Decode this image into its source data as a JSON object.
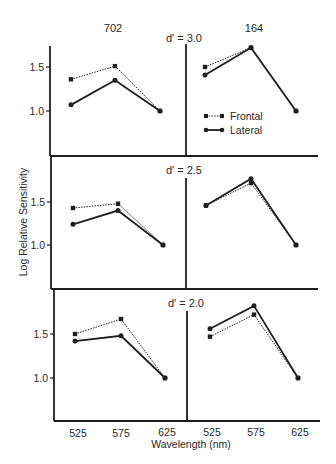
{
  "chart_data": {
    "type": "line",
    "title": "",
    "xlabel": "Wavelength (nm)",
    "ylabel": "Log Relative Sensitivity",
    "categories": [
      "525",
      "575",
      "625"
    ],
    "column_labels": [
      "702",
      "164"
    ],
    "ylim": [
      0.6,
      1.8
    ],
    "yticks": [
      "1.0",
      "1.5"
    ],
    "grid": false,
    "legend": {
      "position": "upper-right panel (top row, column 164)",
      "entries": [
        "Frontal",
        "Lateral"
      ]
    },
    "series_styles": {
      "Frontal": {
        "line": "dotted",
        "marker": "square"
      },
      "Lateral": {
        "line": "solid",
        "marker": "circle"
      }
    },
    "panels": [
      {
        "row_label": "d′ = 3.0",
        "column": "702",
        "series": [
          {
            "name": "Frontal",
            "values": [
              1.36,
              1.51,
              1.0
            ]
          },
          {
            "name": "Lateral",
            "values": [
              1.07,
              1.35,
              1.0
            ]
          }
        ]
      },
      {
        "row_label": "d′ = 3.0",
        "column": "164",
        "series": [
          {
            "name": "Frontal",
            "values": [
              1.5,
              1.72,
              1.0
            ]
          },
          {
            "name": "Lateral",
            "values": [
              1.41,
              1.72,
              1.0
            ]
          }
        ]
      },
      {
        "row_label": "d′ = 2.5",
        "column": "702",
        "series": [
          {
            "name": "Frontal",
            "values": [
              1.43,
              1.48,
              1.0
            ]
          },
          {
            "name": "Lateral",
            "values": [
              1.24,
              1.4,
              1.0
            ]
          }
        ]
      },
      {
        "row_label": "d′ = 2.5",
        "column": "164",
        "series": [
          {
            "name": "Frontal",
            "values": [
              1.46,
              1.72,
              1.0
            ]
          },
          {
            "name": "Lateral",
            "values": [
              1.46,
              1.77,
              1.0
            ]
          }
        ]
      },
      {
        "row_label": "d′ = 2.0",
        "column": "702",
        "series": [
          {
            "name": "Frontal",
            "values": [
              1.5,
              1.67,
              1.0
            ]
          },
          {
            "name": "Lateral",
            "values": [
              1.42,
              1.48,
              1.0
            ]
          }
        ]
      },
      {
        "row_label": "d′ = 2.0",
        "column": "164",
        "series": [
          {
            "name": "Frontal",
            "values": [
              1.47,
              1.72,
              1.0
            ]
          },
          {
            "name": "Lateral",
            "values": [
              1.56,
              1.82,
              1.0
            ]
          }
        ]
      }
    ]
  },
  "labels": {
    "col_left": "702",
    "col_right": "164",
    "row1": "d′ = 3.0",
    "row2": "d′ = 2.5",
    "row3": "d′ = 2.0",
    "ylabel": "Log Relative Sensitivity",
    "xlabel": "Wavelength (nm)",
    "legend_frontal": "Frontal",
    "legend_lateral": "Lateral",
    "ytick_high": "1.5",
    "ytick_low": "1.0",
    "xticks": [
      "525",
      "575",
      "625",
      "525",
      "575",
      "625"
    ]
  },
  "colors": {
    "ink": "#1e1e1e",
    "background": "#ffffff"
  }
}
